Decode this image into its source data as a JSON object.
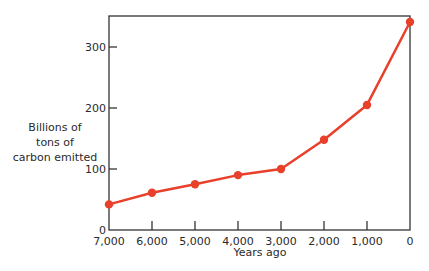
{
  "chart_data": {
    "type": "line",
    "title": "",
    "xlabel": "Years ago",
    "ylabel": "Billions of tons of carbon emitted",
    "ylabel_lines": [
      "Billions of",
      "tons of",
      "carbon emitted"
    ],
    "x": [
      7000,
      6000,
      5000,
      4000,
      3000,
      2000,
      1000,
      0
    ],
    "x_tick_labels": [
      "7,000",
      "6,000",
      "5,000",
      "4,000",
      "3,000",
      "2,000",
      "1,000",
      "0"
    ],
    "y_tick_labels": [
      "0",
      "100",
      "200",
      "300"
    ],
    "y_ticks": [
      0,
      100,
      200,
      300
    ],
    "series": [
      {
        "name": "Carbon emitted",
        "color": "#e8402a",
        "values": [
          42,
          61,
          75,
          90,
          100,
          148,
          205,
          341
        ]
      }
    ],
    "xlim": [
      7000,
      0
    ],
    "ylim": [
      0,
      350
    ],
    "grid": false,
    "legend": "none",
    "x_reversed": true
  },
  "colors": {
    "axis": "#333333",
    "line": "#e8402a",
    "marker": "#e8402a"
  }
}
